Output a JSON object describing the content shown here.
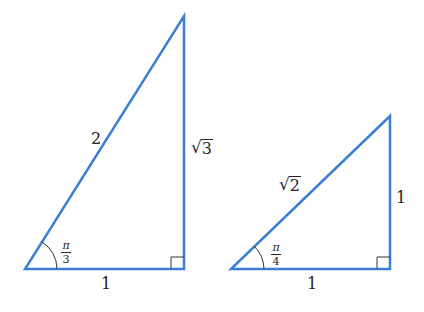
{
  "colors": {
    "stroke": "#3a7fd5",
    "right_angle_mark": "#333333",
    "text": "#222222",
    "background": "#ffffff"
  },
  "triangles": [
    {
      "name": "30-60-90 triangle",
      "vertices": [
        [
          25,
          269
        ],
        [
          184,
          269
        ],
        [
          184,
          16
        ]
      ],
      "hypotenuse": "2",
      "adjacent": "1",
      "opposite_radical_sign": "√",
      "opposite_radicand": "3",
      "angle": {
        "numerator": "π",
        "denominator": "3"
      }
    },
    {
      "name": "45-45-90 triangle",
      "vertices": [
        [
          231,
          269
        ],
        [
          390,
          269
        ],
        [
          390,
          116
        ]
      ],
      "hypotenuse_radical_sign": "√",
      "hypotenuse_radicand": "2",
      "adjacent": "1",
      "opposite": "1",
      "angle": {
        "numerator": "π",
        "denominator": "4"
      }
    }
  ]
}
